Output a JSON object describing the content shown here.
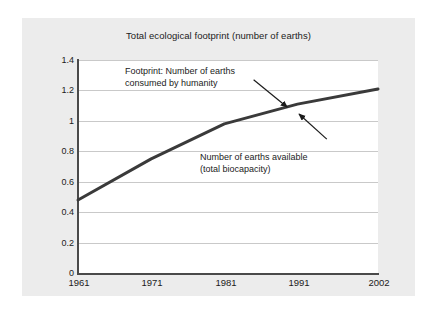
{
  "figure": {
    "background_color": "#ffffff",
    "card_color": "#ececec",
    "plot_background_color": "#ffffff"
  },
  "chart_data": {
    "type": "line",
    "title": "Total ecological footprint (number of earths)",
    "xlabel": "",
    "ylabel": "",
    "x": [
      1961,
      1971,
      1981,
      1991,
      2002
    ],
    "xtick_labels": [
      "1961",
      "1971",
      "1981",
      "1991",
      "2002"
    ],
    "ytick_labels": [
      "0",
      "0.2",
      "0.4",
      "0.6",
      "0.8",
      "1",
      "1.2",
      "1.4"
    ],
    "ytick_values": [
      0,
      0.2,
      0.4,
      0.6,
      0.8,
      1,
      1.2,
      1.4
    ],
    "ylim": [
      0,
      1.4
    ],
    "xlim": [
      1961,
      2002
    ],
    "grid": "horizontal",
    "legend_position": "none",
    "series": [
      {
        "name": "Total ecological footprint",
        "color": "#3a3a3a",
        "line_width": 3,
        "values": [
          0.48,
          0.75,
          0.98,
          1.11,
          1.21
        ]
      }
    ],
    "annotations": [
      {
        "id": "footprint",
        "text": "Footprint: Number of earths\nconsumed by humanity",
        "arrow_from": [
          1985.0,
          1.27
        ],
        "arrow_to": [
          1989.6,
          1.09
        ]
      },
      {
        "id": "biocapacity",
        "text": "Number of earths available\n(total biocapacity)",
        "arrow_from": [
          1995.0,
          0.88
        ],
        "arrow_to": [
          1991.2,
          1.045
        ]
      }
    ]
  }
}
